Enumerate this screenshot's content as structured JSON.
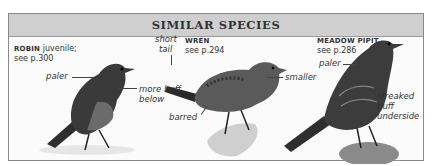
{
  "header": {
    "title": "SIMILAR SPECIES"
  },
  "species": [
    {
      "name": "ROBIN",
      "suffix": " juvenile;",
      "ref": "see p.300",
      "notes": [
        "paler",
        "more buff",
        "below"
      ]
    },
    {
      "name": "WREN",
      "ref": "see p.294",
      "notes": [
        "short",
        "tail",
        "smaller",
        "barred"
      ]
    },
    {
      "name": "MEADOW PIPIT",
      "ref": "see p.286",
      "notes": [
        "paler",
        "streaked",
        "buff",
        "underside"
      ]
    }
  ],
  "colors": {
    "header_bg": "#cfcfcf",
    "border": "#8a8a8a",
    "text": "#333333"
  }
}
